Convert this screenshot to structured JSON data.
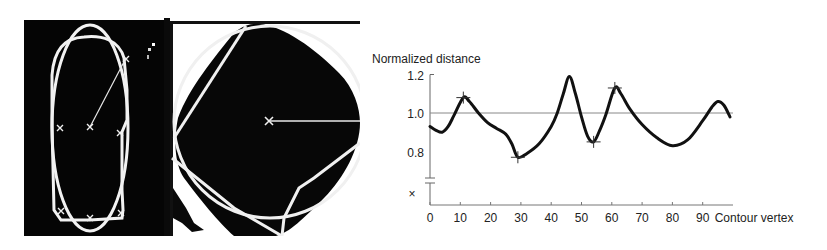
{
  "figure": {
    "panels": [
      {
        "id": "a",
        "description": "Binary image of elongated object with fitted ellipse, contour polygon, vertex markers and radius line"
      },
      {
        "id": "b",
        "description": "Binary image of rounded square object with fitted circle, contour lines, center marker and horizontal radius line"
      }
    ]
  },
  "chart_data": {
    "type": "line",
    "title": "",
    "ylabel": "Normalized distance",
    "xlabel": "Contour vertex",
    "y_ticks": [
      "1.2",
      "1.0",
      "0.8"
    ],
    "y_break_symbol": "×",
    "x_ticks": [
      "0",
      "10",
      "20",
      "30",
      "40",
      "50",
      "60",
      "70",
      "80",
      "90"
    ],
    "xlim": [
      0,
      100
    ],
    "ylim": [
      0.7,
      1.2
    ],
    "reference_line": 1.0,
    "grid": false,
    "series": [
      {
        "name": "Normalized distance",
        "x": [
          0,
          2,
          4,
          6,
          8,
          11,
          13,
          16,
          19,
          22,
          25,
          27,
          29,
          32,
          36,
          40,
          42,
          44,
          46,
          48,
          50,
          52,
          54,
          56,
          58,
          61,
          63,
          66,
          70,
          75,
          80,
          85,
          90,
          93,
          95,
          97,
          99
        ],
        "values": [
          0.93,
          0.91,
          0.9,
          0.93,
          0.99,
          1.08,
          1.06,
          1.0,
          0.95,
          0.92,
          0.89,
          0.84,
          0.77,
          0.79,
          0.84,
          0.93,
          1.0,
          1.1,
          1.19,
          1.1,
          0.98,
          0.88,
          0.85,
          0.91,
          0.99,
          1.13,
          1.1,
          1.02,
          0.94,
          0.87,
          0.83,
          0.86,
          0.96,
          1.03,
          1.06,
          1.04,
          0.98
        ]
      }
    ],
    "marked_extrema": [
      {
        "x": 11,
        "y": 1.08
      },
      {
        "x": 29,
        "y": 0.77
      },
      {
        "x": 54,
        "y": 0.85
      },
      {
        "x": 61,
        "y": 1.13
      }
    ]
  }
}
